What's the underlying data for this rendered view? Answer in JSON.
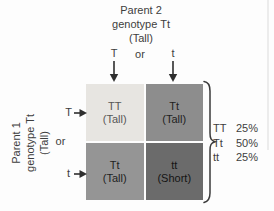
{
  "parent2": {
    "name_line": "Parent 2",
    "genotype_line": "genotype Tt",
    "phenotype_line": "(Tall)",
    "allele_left": "T",
    "or_label": "or",
    "allele_right": "t"
  },
  "parent1": {
    "name_line": "Parent 1",
    "genotype_line": "genotype Tt",
    "phenotype_line": "(Tall)",
    "allele_top": "T",
    "or_label": "or",
    "allele_bottom": "t"
  },
  "punnett_cells": [
    {
      "genotype": "TT",
      "phenotype": "(Tall)",
      "bg": "#e7e5e1",
      "fg": "#575757"
    },
    {
      "genotype": "Tt",
      "phenotype": "(Tall)",
      "bg": "#8d8d8d",
      "fg": "#1f1f1f"
    },
    {
      "genotype": "Tt",
      "phenotype": "(Tall)",
      "bg": "#959595",
      "fg": "#1f1f1f"
    },
    {
      "genotype": "tt",
      "phenotype": "(Short)",
      "bg": "#6b6b6b",
      "fg": "#141414"
    }
  ],
  "results": {
    "rows": [
      {
        "genotype": "TT",
        "percent": "25%"
      },
      {
        "genotype": "Tt",
        "percent": "50%"
      },
      {
        "genotype": "tt",
        "percent": "25%"
      }
    ]
  },
  "colors": {
    "arrow": "#2e2e2e",
    "brace": "#3a3a3a",
    "background": "#fdfdfd"
  }
}
